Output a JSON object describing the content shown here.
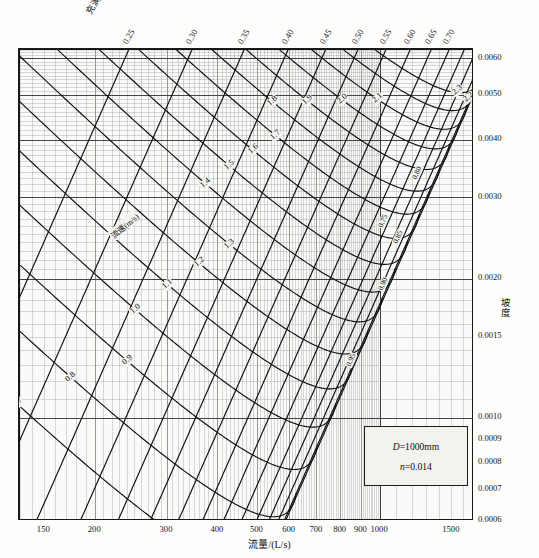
{
  "titles": {
    "bottom_axis": "流量/(L/s)",
    "right_axis": "坡度",
    "top_axis": "充满度 h/D",
    "velocity_series": "流速(m/s)"
  },
  "legend": {
    "diameter_symbol": "D",
    "diameter_value": "=1000mm",
    "roughness_symbol": "n",
    "roughness_value": "=0.014"
  },
  "axes": {
    "bottom_ticks": [
      "150",
      "200",
      "300",
      "400",
      "500",
      "600",
      "700",
      "800",
      "900",
      "1000",
      "1500"
    ],
    "right_ticks": [
      "0.0060",
      "0.0050",
      "0.0040",
      "0.0030",
      "0.0020",
      "0.0015",
      "0.0010",
      "0.0009",
      "0.0008",
      "0.0007",
      "0.0006"
    ],
    "top_ticks": [
      "0.25",
      "0.30",
      "0.35",
      "0.40",
      "0.45",
      "0.50",
      "0.55",
      "0.60",
      "0.65",
      "0.70"
    ]
  },
  "velocity_labels": [
    "0.7",
    "0.8",
    "0.9",
    "1.0",
    "1.1",
    "1.2",
    "1.3",
    "1.4",
    "1.5",
    "1.6",
    "1.7",
    "1.8",
    "1.9",
    "2.0",
    "2.1",
    "2.2",
    "2.3"
  ],
  "fullness_inner_labels": [
    "0.75",
    "0.80",
    "0.85",
    "0.90",
    "0.95"
  ],
  "colors": {
    "ink": "#1a1a1a",
    "grid_minor": "#9a9a96",
    "grid_major": "#4a4a48",
    "plot_bg": "#fafaf8",
    "page_bg": "#fdfdfb"
  },
  "chart_data": {
    "type": "line",
    "xlabel": "流量/(L/s)",
    "ylabel": "坡度",
    "xscale": "log",
    "yscale": "log",
    "xlim": [
      130,
      1700
    ],
    "ylim": [
      0.0006,
      0.0063
    ],
    "grid": true,
    "legend_position": "inside-bottom-right",
    "x_ticks": [
      150,
      200,
      300,
      400,
      500,
      600,
      700,
      800,
      900,
      1000,
      1500
    ],
    "y_ticks": [
      0.0006,
      0.0007,
      0.0008,
      0.0009,
      0.001,
      0.0015,
      0.002,
      0.003,
      0.004,
      0.005,
      0.006
    ],
    "top_axis_label": "充满度 h/D",
    "top_axis_ticks": [
      0.25,
      0.3,
      0.35,
      0.4,
      0.45,
      0.5,
      0.55,
      0.6,
      0.65,
      0.7
    ],
    "series": [
      {
        "name": "充满度 h/D = 0.25",
        "kind": "fullness",
        "value": 0.25
      },
      {
        "name": "充满度 h/D = 0.30",
        "kind": "fullness",
        "value": 0.3
      },
      {
        "name": "充满度 h/D = 0.35",
        "kind": "fullness",
        "value": 0.35
      },
      {
        "name": "充满度 h/D = 0.40",
        "kind": "fullness",
        "value": 0.4
      },
      {
        "name": "充满度 h/D = 0.45",
        "kind": "fullness",
        "value": 0.45
      },
      {
        "name": "充满度 h/D = 0.50",
        "kind": "fullness",
        "value": 0.5
      },
      {
        "name": "充满度 h/D = 0.55",
        "kind": "fullness",
        "value": 0.55
      },
      {
        "name": "充满度 h/D = 0.60",
        "kind": "fullness",
        "value": 0.6
      },
      {
        "name": "充满度 h/D = 0.65",
        "kind": "fullness",
        "value": 0.65
      },
      {
        "name": "充满度 h/D = 0.70",
        "kind": "fullness",
        "value": 0.7
      },
      {
        "name": "充满度 h/D = 0.75",
        "kind": "fullness",
        "value": 0.75
      },
      {
        "name": "充满度 h/D = 0.80",
        "kind": "fullness",
        "value": 0.8
      },
      {
        "name": "充满度 h/D = 0.85",
        "kind": "fullness",
        "value": 0.85
      },
      {
        "name": "充满度 h/D = 0.90",
        "kind": "fullness",
        "value": 0.9
      },
      {
        "name": "充满度 h/D = 0.95",
        "kind": "fullness",
        "value": 0.95
      },
      {
        "name": "流速 v = 0.7 m/s",
        "kind": "velocity",
        "value": 0.7
      },
      {
        "name": "流速 v = 0.8 m/s",
        "kind": "velocity",
        "value": 0.8
      },
      {
        "name": "流速 v = 0.9 m/s",
        "kind": "velocity",
        "value": 0.9
      },
      {
        "name": "流速 v = 1.0 m/s",
        "kind": "velocity",
        "value": 1.0
      },
      {
        "name": "流速 v = 1.1 m/s",
        "kind": "velocity",
        "value": 1.1
      },
      {
        "name": "流速 v = 1.2 m/s",
        "kind": "velocity",
        "value": 1.2
      },
      {
        "name": "流速 v = 1.3 m/s",
        "kind": "velocity",
        "value": 1.3
      },
      {
        "name": "流速 v = 1.4 m/s",
        "kind": "velocity",
        "value": 1.4
      },
      {
        "name": "流速 v = 1.5 m/s",
        "kind": "velocity",
        "value": 1.5
      },
      {
        "name": "流速 v = 1.6 m/s",
        "kind": "velocity",
        "value": 1.6
      },
      {
        "name": "流速 v = 1.7 m/s",
        "kind": "velocity",
        "value": 1.7
      },
      {
        "name": "流速 v = 1.8 m/s",
        "kind": "velocity",
        "value": 1.8
      },
      {
        "name": "流速 v = 1.9 m/s",
        "kind": "velocity",
        "value": 1.9
      },
      {
        "name": "流速 v = 2.0 m/s",
        "kind": "velocity",
        "value": 2.0
      },
      {
        "name": "流速 v = 2.1 m/s",
        "kind": "velocity",
        "value": 2.1
      },
      {
        "name": "流速 v = 2.2 m/s",
        "kind": "velocity",
        "value": 2.2
      },
      {
        "name": "流速 v = 2.3 m/s",
        "kind": "velocity",
        "value": 2.3
      }
    ],
    "annotations": [
      {
        "text": "D =1000mm"
      },
      {
        "text": "n =0.014"
      }
    ]
  }
}
